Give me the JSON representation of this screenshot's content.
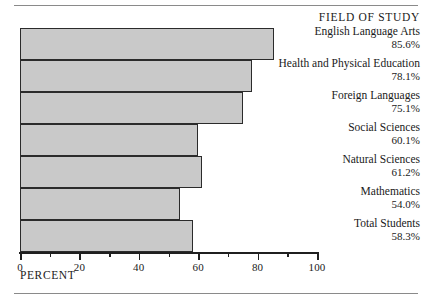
{
  "chart_data": {
    "type": "bar",
    "orientation": "horizontal",
    "title": "",
    "xlabel": "PERCENT",
    "ylabel": "",
    "legend_title": "FIELD OF STUDY",
    "xlim": [
      0,
      100
    ],
    "grid": false,
    "legend_position": "right",
    "major_tick_step": 20,
    "minor_tick_step": 10,
    "categories": [
      "English Language Arts",
      "Health and Physical Education",
      "Foreign  Languages",
      "Social Sciences",
      "Natural Sciences",
      "Mathematics",
      "Total Students"
    ],
    "values": [
      85.6,
      78.1,
      75.1,
      60.1,
      61.2,
      54.0,
      58.3
    ],
    "value_labels": [
      "85.6%",
      "78.1%",
      "75.1%",
      "60.1%",
      "61.2%",
      "54.0%",
      "58.3%"
    ],
    "tick_labels": [
      "0",
      "20",
      "40",
      "60",
      "80",
      "100"
    ],
    "tick_values": [
      0,
      20,
      40,
      60,
      80,
      100
    ],
    "minor_tick_values": [
      10,
      30,
      50,
      70,
      90
    ],
    "colors": {
      "bar_fill": "#c9c9c9",
      "bar_border": "#2b2b2b",
      "axis": "#1f1f1f",
      "text": "#1a1a1a",
      "rule": "#8a8a8a",
      "background": "#ffffff"
    }
  },
  "axis": {
    "xlabel": "PERCENT"
  },
  "legend": {
    "title": "FIELD OF STUDY",
    "entries": [
      {
        "label": "English Language Arts",
        "value": "85.6%"
      },
      {
        "label": "Health and Physical Education",
        "value": "78.1%"
      },
      {
        "label": "Foreign  Languages",
        "value": "75.1%"
      },
      {
        "label": "Social Sciences",
        "value": "60.1%"
      },
      {
        "label": "Natural Sciences",
        "value": "61.2%"
      },
      {
        "label": "Mathematics",
        "value": "54.0%"
      },
      {
        "label": "Total Students",
        "value": "58.3%"
      }
    ]
  }
}
